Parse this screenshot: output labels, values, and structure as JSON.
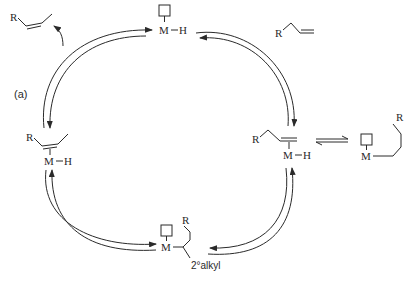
{
  "diagram": {
    "type": "catalytic-cycle",
    "step_label": "(a)",
    "colors": {
      "stroke": "#2a2a2a",
      "background": "#ffffff"
    },
    "species": {
      "internal_alkene_product": {
        "R": "R"
      },
      "metal_hydride": {
        "M": "M",
        "H": "H"
      },
      "terminal_alkene": {
        "R": "R"
      },
      "pi_complex_terminal": {
        "R": "R",
        "M": "M",
        "H": "H"
      },
      "primary_alkyl": {
        "R": "R",
        "M": "M"
      },
      "secondary_alkyl": {
        "R": "R",
        "M": "M",
        "label": "2°alkyl"
      },
      "pi_complex_internal": {
        "R": "R",
        "M": "M",
        "H": "H"
      }
    }
  }
}
